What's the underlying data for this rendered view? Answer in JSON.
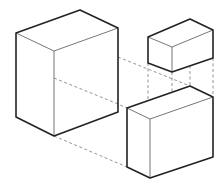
{
  "diagram": {
    "colors": {
      "outline": "#222222",
      "inner_edge": "#666666",
      "dashed": "#888888",
      "background": "#ffffff"
    },
    "boxes": [
      {
        "name": "large-box-left",
        "vertices": {
          "top_left": [
            16,
            33
          ],
          "top_back": [
            80,
            10
          ],
          "top_right": [
            118,
            28
          ],
          "front_top": [
            54,
            51
          ],
          "bottom_left": [
            16,
            117
          ],
          "bottom_front": [
            54,
            136
          ],
          "bottom_right": [
            118,
            112
          ]
        }
      },
      {
        "name": "small-box-top-right",
        "vertices": {
          "top_left": [
            148,
            37
          ],
          "top_back": [
            190,
            19
          ],
          "top_right": [
            213,
            30
          ],
          "front_top": [
            172,
            47
          ],
          "bottom_left": [
            148,
            63
          ],
          "bottom_front": [
            172,
            72
          ],
          "bottom_right": [
            213,
            58
          ]
        }
      },
      {
        "name": "medium-box-bottom-right",
        "vertices": {
          "top_left": [
            127,
            108
          ],
          "top_back": [
            190,
            86
          ],
          "top_right": [
            213,
            97
          ],
          "front_top": [
            150,
            119
          ],
          "bottom_left": [
            127,
            167
          ],
          "bottom_front": [
            150,
            178
          ],
          "bottom_right": [
            213,
            157
          ]
        }
      }
    ],
    "dashed_lines": [
      [
        [
          54,
          78
        ],
        [
          127,
          108
        ]
      ],
      [
        [
          54,
          136
        ],
        [
          127,
          167
        ]
      ],
      [
        [
          118,
          57
        ],
        [
          190,
          86
        ]
      ],
      [
        [
          148,
          63
        ],
        [
          148,
          108
        ]
      ],
      [
        [
          172,
          72
        ],
        [
          172,
          113
        ]
      ],
      [
        [
          190,
          60
        ],
        [
          190,
          86
        ]
      ],
      [
        [
          213,
          58
        ],
        [
          213,
          97
        ]
      ]
    ]
  }
}
